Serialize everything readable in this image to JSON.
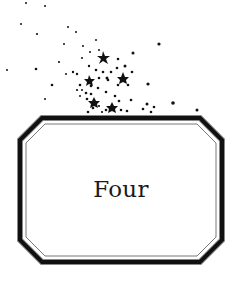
{
  "page": {
    "chapter_title": "Four",
    "ornament": "star-scatter-icon",
    "frame": "octagonal-double-rule-frame"
  },
  "colors": {
    "ink": "#111111",
    "background": "#ffffff"
  }
}
